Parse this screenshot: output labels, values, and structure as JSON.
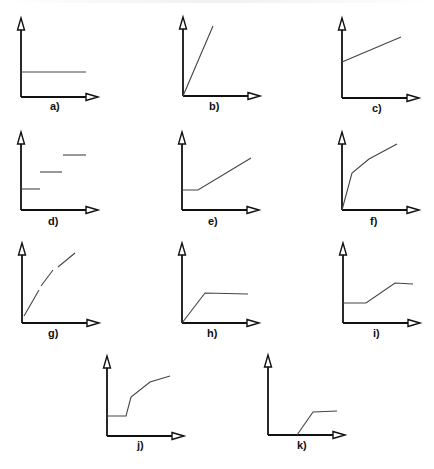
{
  "graphs": [
    {
      "id": "a",
      "label": "a)",
      "origin": [
        21,
        97
      ],
      "axis_x_end": 98,
      "axis_y_top": 18,
      "segments": [
        [
          [
            21,
            72
          ],
          [
            86,
            72
          ]
        ]
      ],
      "label_pos": [
        50,
        110
      ]
    },
    {
      "id": "b",
      "label": "b)",
      "origin": [
        183,
        96
      ],
      "axis_x_end": 260,
      "axis_y_top": 17,
      "segments": [
        [
          [
            183,
            96
          ],
          [
            213,
            26
          ]
        ]
      ],
      "label_pos": [
        209,
        110
      ]
    },
    {
      "id": "c",
      "label": "c)",
      "origin": [
        342,
        98
      ],
      "axis_x_end": 419,
      "axis_y_top": 18,
      "segments": [
        [
          [
            342,
            62
          ],
          [
            401,
            37
          ]
        ]
      ],
      "label_pos": [
        372,
        112
      ]
    },
    {
      "id": "d",
      "label": "d)",
      "origin": [
        21,
        210
      ],
      "axis_x_end": 98,
      "axis_y_top": 132,
      "segments": [
        [
          [
            21,
            189
          ],
          [
            40,
            189
          ]
        ],
        [
          [
            40,
            172
          ],
          [
            62,
            172
          ]
        ],
        [
          [
            63,
            155
          ],
          [
            86,
            155
          ]
        ]
      ],
      "label_pos": [
        48,
        225
      ]
    },
    {
      "id": "e",
      "label": "e)",
      "origin": [
        182,
        210
      ],
      "axis_x_end": 259,
      "axis_y_top": 132,
      "segments": [
        [
          [
            182,
            190
          ],
          [
            198,
            190
          ],
          [
            251,
            158
          ]
        ]
      ],
      "label_pos": [
        208,
        225
      ]
    },
    {
      "id": "f",
      "label": "f)",
      "origin": [
        342,
        210
      ],
      "axis_x_end": 419,
      "axis_y_top": 132,
      "segments": [
        [
          [
            342,
            210
          ],
          [
            352,
            173
          ],
          [
            369,
            159
          ],
          [
            397,
            144
          ]
        ]
      ],
      "label_pos": [
        370,
        225
      ]
    },
    {
      "id": "g",
      "label": "g)",
      "origin": [
        22,
        323
      ],
      "axis_x_end": 99,
      "axis_y_top": 243,
      "segments": [
        [
          [
            24,
            316
          ],
          [
            39,
            290
          ]
        ],
        [
          [
            41,
            286
          ],
          [
            53,
            270
          ]
        ],
        [
          [
            58,
            267
          ],
          [
            75,
            253
          ]
        ]
      ],
      "label_pos": [
        48,
        337
      ]
    },
    {
      "id": "h",
      "label": "h)",
      "origin": [
        182,
        323
      ],
      "axis_x_end": 259,
      "axis_y_top": 243,
      "segments": [
        [
          [
            182,
            323
          ],
          [
            205,
            293
          ],
          [
            248,
            294
          ]
        ]
      ],
      "label_pos": [
        207,
        337
      ]
    },
    {
      "id": "i",
      "label": "i)",
      "origin": [
        343,
        323
      ],
      "axis_x_end": 420,
      "axis_y_top": 243,
      "segments": [
        [
          [
            343,
            303
          ],
          [
            366,
            303
          ],
          [
            395,
            283
          ],
          [
            413,
            284
          ]
        ]
      ],
      "label_pos": [
        373,
        337
      ]
    },
    {
      "id": "j",
      "label": "j)",
      "origin": [
        107,
        436
      ],
      "axis_x_end": 184,
      "axis_y_top": 356,
      "segments": [
        [
          [
            107,
            416
          ],
          [
            126,
            416
          ],
          [
            131,
            397
          ],
          [
            150,
            382
          ],
          [
            170,
            376
          ]
        ]
      ],
      "label_pos": [
        137,
        449
      ]
    },
    {
      "id": "k",
      "label": "k)",
      "origin": [
        268,
        435
      ],
      "axis_x_end": 345,
      "axis_y_top": 355,
      "segments": [
        [
          [
            297,
            435
          ],
          [
            313,
            412
          ],
          [
            337,
            411
          ]
        ]
      ],
      "label_pos": [
        297,
        449
      ]
    }
  ],
  "colors": {
    "axis": "#111111",
    "curve": "#444444",
    "background": "#ffffff"
  }
}
